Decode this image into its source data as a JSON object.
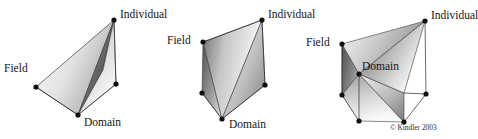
{
  "figure": {
    "background_color": "#ffffff",
    "label_color": "#141414",
    "edge_color": "#2a2a2a",
    "vertex_color": "#101010",
    "gradient_light": "#fcfcfc",
    "gradient_mid": "#b8b8b8",
    "gradient_dark": "#4a4a4a",
    "gradient_darkest": "#2e2e2e",
    "copyright": "© Kindler 2003",
    "panels": [
      {
        "id": "panel-1",
        "name": "flat-triangle-view",
        "labels": {
          "individual": "Individual",
          "field": "Field",
          "domain": "Domain"
        }
      },
      {
        "id": "panel-2",
        "name": "folded-wedge-view",
        "labels": {
          "individual": "Individual",
          "field": "Field",
          "domain": "Domain"
        }
      },
      {
        "id": "panel-3",
        "name": "prism-view",
        "labels": {
          "individual": "Individual",
          "field": "Field",
          "domain": "Domain"
        }
      }
    ]
  }
}
